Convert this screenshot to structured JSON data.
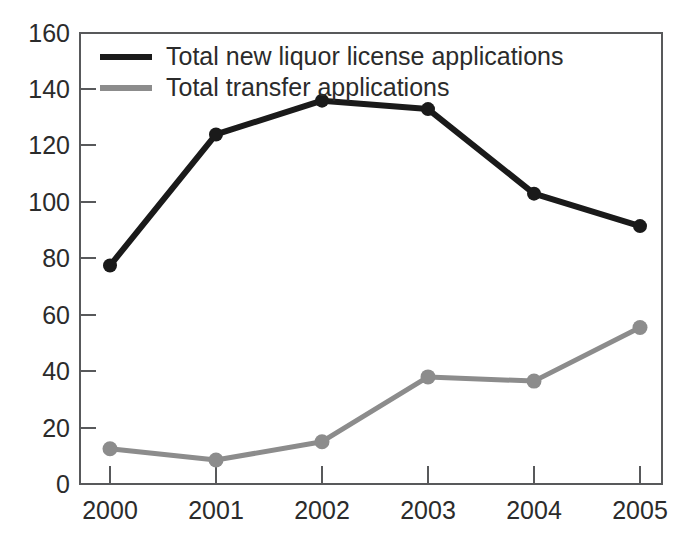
{
  "chart_data": {
    "type": "line",
    "title": "",
    "xlabel": "",
    "ylabel": "",
    "categories": [
      "2000",
      "2001",
      "2002",
      "2003",
      "2004",
      "2005"
    ],
    "x": [
      2000,
      2001,
      2002,
      2003,
      2004,
      2005
    ],
    "series": [
      {
        "name": "Total new liquor license applications",
        "color": "#1a1a1a",
        "marker": "circle",
        "values": [
          77.5,
          124,
          136,
          133,
          103,
          91.5
        ]
      },
      {
        "name": "Total transfer applications",
        "color": "#8c8c8c",
        "marker": "circle",
        "values": [
          12.5,
          8.5,
          15,
          38,
          36.5,
          55.5
        ]
      }
    ],
    "ylim": [
      0,
      160
    ],
    "yticks": [
      0,
      20,
      40,
      60,
      80,
      100,
      120,
      140,
      160
    ],
    "ytick_labels": [
      "0",
      "20",
      "40",
      "60",
      "80",
      "100",
      "120",
      "140",
      "160"
    ],
    "xtick_labels": [
      "2000",
      "2001",
      "2002",
      "2003",
      "2004",
      "2005"
    ],
    "grid": false,
    "legend_position": "top-left-inside",
    "frame": true
  },
  "legend": {
    "entries": [
      {
        "label": "Total new liquor license applications",
        "swatch": "black-line-swatch"
      },
      {
        "label": "Total transfer applications",
        "swatch": "gray-line-swatch"
      }
    ]
  },
  "axes": {
    "y_ticks": [
      "160",
      "140",
      "120",
      "100",
      "80",
      "60",
      "40",
      "20",
      "0"
    ],
    "x_ticks": [
      "2000",
      "2001",
      "2002",
      "2003",
      "2004",
      "2005"
    ]
  },
  "colors": {
    "series_black": "#1a1a1a",
    "series_gray": "#8c8c8c",
    "axis": "#58595b",
    "text": "#2b2b2b",
    "background": "#ffffff"
  }
}
